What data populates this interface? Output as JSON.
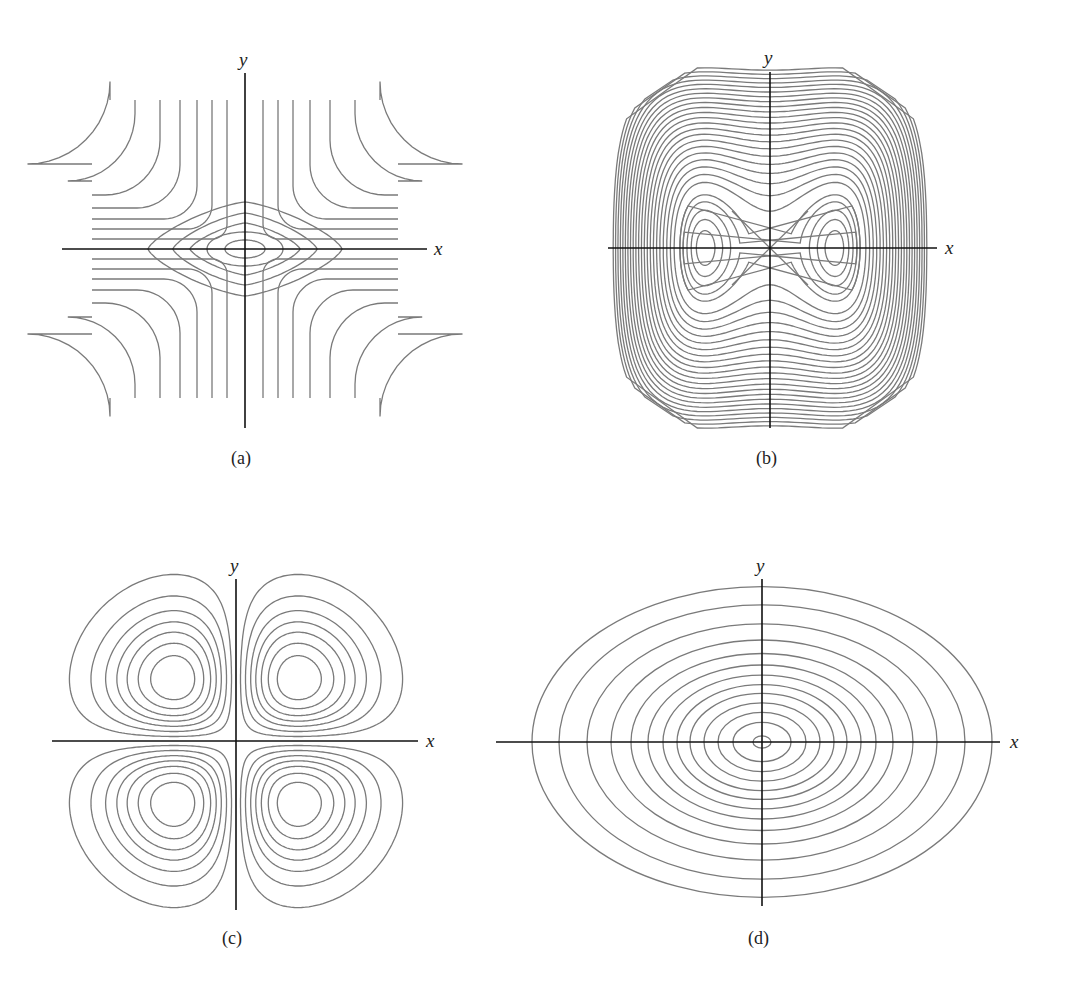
{
  "figure": {
    "panels": [
      {
        "id": "a",
        "caption": "(a)",
        "xlabel": "x",
        "ylabel": "y"
      },
      {
        "id": "b",
        "caption": "(b)",
        "xlabel": "x",
        "ylabel": "y"
      },
      {
        "id": "c",
        "caption": "(c)",
        "xlabel": "x",
        "ylabel": "y"
      },
      {
        "id": "d",
        "caption": "(d)",
        "xlabel": "x",
        "ylabel": "y"
      }
    ],
    "colors": {
      "contour": "#7a7a7a",
      "axis": "#111111",
      "background": "#ffffff"
    }
  },
  "chart_data": [
    {
      "type": "contour",
      "panel": "(a)",
      "title": "",
      "xlabel": "x",
      "ylabel": "y",
      "description": "Saddle-type level curves: closed nested diamond/oval contours around the origin (local extremum) surrounded by hyperbola-like curves opening toward the four corners",
      "closed_contours_at_origin": 5,
      "open_curves_per_quadrant": 7,
      "center": [
        0,
        0
      ],
      "grid": false,
      "legend": false
    },
    {
      "type": "contour",
      "panel": "(b)",
      "title": "",
      "xlabel": "x",
      "ylabel": "y",
      "description": "Double-well level curves: two local extrema on the x-axis symmetric about origin, saddle point at origin with X-shaped separatrix, many nested rounded-square outer contours",
      "extrema_x": [
        -1,
        1
      ],
      "saddle": [
        0,
        0
      ],
      "nested_contours": 28,
      "grid": false,
      "legend": false
    },
    {
      "type": "contour",
      "panel": "(c)",
      "title": "",
      "xlabel": "x",
      "ylabel": "y",
      "description": "Four-lobed (clover) level curves, one set of nested closed contours in each quadrant, extrema at (±a, ±a)",
      "lobes": 4,
      "contours_per_lobe": 7,
      "grid": false,
      "legend": false
    },
    {
      "type": "contour",
      "panel": "(d)",
      "title": "",
      "xlabel": "x",
      "ylabel": "y",
      "description": "Concentric ellipses centered at origin, wider along x than y (single extremum)",
      "ellipse_count": 13,
      "aspect_ratio_x_to_y": 1.48,
      "center": [
        0,
        0
      ],
      "grid": false,
      "legend": false
    }
  ]
}
